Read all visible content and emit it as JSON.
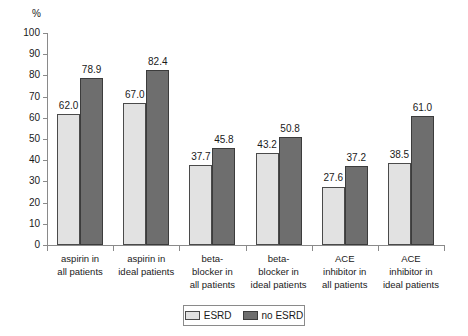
{
  "chart_data": {
    "type": "bar",
    "title": "",
    "xlabel": "",
    "ylabel": "%",
    "ylim": [
      0,
      100
    ],
    "ytick_step": 10,
    "yticks": [
      "100",
      "90",
      "80",
      "70",
      "60",
      "50",
      "40",
      "30",
      "20",
      "10",
      "0"
    ],
    "grid": false,
    "legend_position": "bottom-center",
    "categories": [
      "aspirin in\nall patients",
      "aspirin in\nideal patients",
      "beta-\nblocker in\nall patients",
      "beta-\nblocker in\nideal patients",
      "ACE\ninhibitor in\nall patients",
      "ACE\ninhibitor in\nideal patients"
    ],
    "category_lines": [
      [
        "aspirin in",
        "all patients"
      ],
      [
        "aspirin in",
        "ideal patients"
      ],
      [
        "beta-",
        "blocker in",
        "all patients"
      ],
      [
        "beta-",
        "blocker in",
        "ideal patients"
      ],
      [
        "ACE",
        "inhibitor in",
        "all patients"
      ],
      [
        "ACE",
        "inhibitor in",
        "ideal patients"
      ]
    ],
    "series": [
      {
        "name": "ESRD",
        "color": "#e2e2e2",
        "values": [
          62.0,
          67.0,
          37.7,
          43.2,
          27.6,
          38.5
        ],
        "labels": [
          "62.0",
          "67.0",
          "37.7",
          "43.2",
          "27.6",
          "38.5"
        ]
      },
      {
        "name": "no ESRD",
        "color": "#6e6e6e",
        "values": [
          78.9,
          82.4,
          45.8,
          50.8,
          37.2,
          61.0
        ],
        "labels": [
          "78.9",
          "82.4",
          "45.8",
          "50.8",
          "37.2",
          "61.0"
        ]
      }
    ]
  },
  "legend": {
    "entries": [
      {
        "label": "ESRD",
        "swatch": "esrd"
      },
      {
        "label": "no ESRD",
        "swatch": "noesrd"
      }
    ]
  }
}
